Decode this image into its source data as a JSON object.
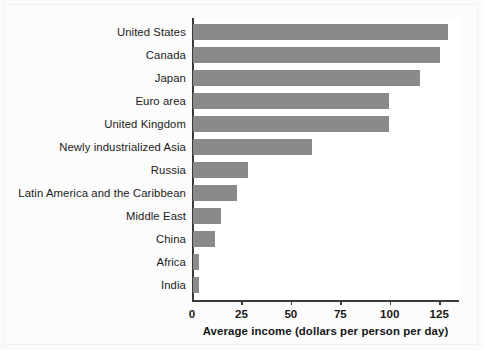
{
  "chart_data": {
    "type": "bar",
    "orientation": "horizontal",
    "title": "",
    "xlabel": "Average income (dollars per person per day)",
    "ylabel": "",
    "xlim": [
      0,
      135
    ],
    "xticks": [
      0,
      25,
      50,
      75,
      100,
      125
    ],
    "xtick_labels": [
      "0",
      "25",
      "50",
      "75",
      "100",
      "125"
    ],
    "grid": false,
    "legend": false,
    "bar_color": "#8a8a8a",
    "axis_color": "#3a3a3a",
    "background": "#ffffff",
    "categories": [
      "United States",
      "Canada",
      "Japan",
      "Euro area",
      "United Kingdom",
      "Newly industrialized Asia",
      "Russia",
      "Latin America and the Caribbean",
      "Middle East",
      "China",
      "Africa",
      "India"
    ],
    "values": [
      129,
      125,
      115,
      99,
      99,
      60,
      28,
      22,
      14,
      11,
      3,
      3
    ]
  }
}
